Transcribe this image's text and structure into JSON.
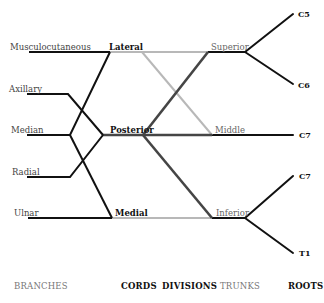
{
  "colors": {
    "black": "#111111",
    "dark_gray": "#444444",
    "light_gray": "#b5b5b5"
  },
  "branches": [
    {
      "label": "Musculocutaneous"
    },
    {
      "label": "Axillary"
    },
    {
      "label": "Median"
    },
    {
      "label": "Radial"
    },
    {
      "label": "Ulnar"
    }
  ],
  "cords": [
    {
      "label": "Lateral"
    },
    {
      "label": "Posterior"
    },
    {
      "label": "Medial"
    }
  ],
  "trunks": [
    {
      "label": "Superior"
    },
    {
      "label": "Middle"
    },
    {
      "label": "Inferior"
    }
  ],
  "roots": [
    {
      "label": "C5"
    },
    {
      "label": "C6"
    },
    {
      "label": "C7"
    },
    {
      "label": "C7"
    },
    {
      "label": "T1"
    }
  ],
  "columns": {
    "branches": "BRANCHES",
    "cords": "CORDS",
    "divisions": "DIVISIONS",
    "trunks": "TRUNKS",
    "roots": "ROOTS"
  }
}
